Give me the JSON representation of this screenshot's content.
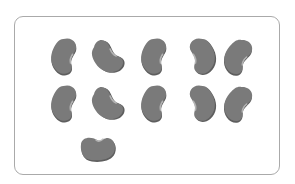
{
  "figure": {
    "bean_count": 11,
    "rows": [
      {
        "row": 1,
        "count": 5
      },
      {
        "row": 2,
        "count": 5
      },
      {
        "row": 3,
        "count": 1
      }
    ],
    "colors": {
      "frame_border": "#aaaaaa",
      "bean_fill": "#7a7a7a",
      "bean_shadow": "#5e5e5e",
      "bean_highlight": "#bdbdbd"
    },
    "beans": [
      {
        "x": 66,
        "y": 55,
        "rot": 20,
        "type": "tall"
      },
      {
        "x": 107,
        "y": 55,
        "rot": -35,
        "type": "wide"
      },
      {
        "x": 156,
        "y": 55,
        "rot": 20,
        "type": "tall"
      },
      {
        "x": 200,
        "y": 55,
        "rot": -20,
        "type": "tallrev"
      },
      {
        "x": 240,
        "y": 56,
        "rot": 35,
        "type": "tall"
      },
      {
        "x": 66,
        "y": 102,
        "rot": 20,
        "type": "tall"
      },
      {
        "x": 107,
        "y": 102,
        "rot": -35,
        "type": "wide"
      },
      {
        "x": 156,
        "y": 102,
        "rot": 20,
        "type": "tall"
      },
      {
        "x": 200,
        "y": 102,
        "rot": -20,
        "type": "tallrev"
      },
      {
        "x": 240,
        "y": 103,
        "rot": 35,
        "type": "tall"
      },
      {
        "x": 97,
        "y": 148,
        "rot": 0,
        "type": "flat"
      }
    ]
  }
}
